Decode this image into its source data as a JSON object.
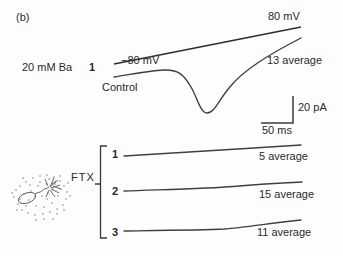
{
  "figure": {
    "panel_label": "(b)",
    "condition_label": "20 mM Ba",
    "top": {
      "trace_number": "1",
      "voltage_start": "−80 mV",
      "voltage_end": "80 mV",
      "trace_label": "Control",
      "average_label": "13 average"
    },
    "scale": {
      "current": "20 pA",
      "time": "50 ms"
    },
    "bottom": {
      "toxin_label": "FTX",
      "traces": [
        {
          "number": "1",
          "average": "5 average"
        },
        {
          "number": "2",
          "average": "15 average"
        },
        {
          "number": "3",
          "average": "11 average"
        }
      ]
    },
    "colors": {
      "trace_line": "#3f3f3f",
      "ramp_line": "#2e2e2e",
      "text": "#2a2a2a",
      "background": "#fdfdfd"
    }
  }
}
